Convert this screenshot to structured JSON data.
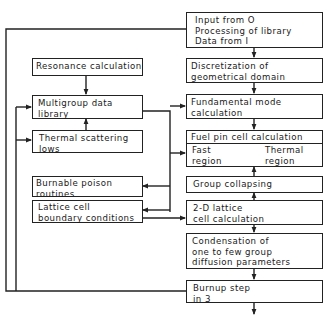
{
  "diagram": {
    "type": "flowchart",
    "boxes": {
      "input": {
        "lines": [
          "Input from O",
          "Processing of library",
          "Data from I"
        ]
      },
      "discretization": {
        "lines": [
          "Discretization of",
          "geometrical domain"
        ]
      },
      "fundamental": {
        "lines": [
          "Fundamental mode",
          "calculation"
        ]
      },
      "fuel_pin": {
        "title": "Fuel pin cell calculation",
        "left": {
          "lines": [
            "Fast",
            "region"
          ]
        },
        "right": {
          "lines": [
            "Thermal",
            "region"
          ]
        }
      },
      "group_collapsing": {
        "lines": [
          "Group collapsing"
        ]
      },
      "lattice_2d": {
        "lines": [
          "2-D lattice",
          "cell calculation"
        ]
      },
      "condensation": {
        "lines": [
          "Condensation of",
          "one to few group",
          "diffusion parameters"
        ]
      },
      "burnup": {
        "lines": [
          "Burnup step",
          "in 3"
        ]
      },
      "resonance": {
        "lines": [
          "Resonance calculation"
        ]
      },
      "multigroup": {
        "lines": [
          "Multigroup data",
          "library"
        ]
      },
      "thermal_scattering": {
        "lines": [
          "Thermal scattering",
          "lows"
        ]
      },
      "burnable_poison": {
        "lines": [
          "Burnable poison",
          "routines"
        ]
      },
      "lattice_boundary": {
        "lines": [
          "Lattice cell",
          "boundary conditions"
        ]
      }
    },
    "edges": [
      [
        "input",
        "discretization"
      ],
      [
        "discretization",
        "fundamental"
      ],
      [
        "fundamental",
        "fuel_pin"
      ],
      [
        "group_collapsing",
        "fuel_pin"
      ],
      [
        "lattice_2d",
        "group_collapsing"
      ],
      [
        "lattice_2d",
        "condensation"
      ],
      [
        "condensation",
        "burnup"
      ],
      [
        "resonance",
        "multigroup"
      ],
      [
        "thermal_scattering",
        "multigroup"
      ],
      [
        "multigroup",
        "fundamental"
      ],
      [
        "multigroup",
        "fuel_pin"
      ],
      [
        "multigroup",
        "burnable_poison"
      ],
      [
        "multigroup",
        "lattice_boundary"
      ],
      [
        "lattice_boundary",
        "lattice_2d"
      ],
      [
        "burnup",
        "input (loop)"
      ],
      [
        "loop",
        "multigroup"
      ],
      [
        "loop",
        "thermal_scattering"
      ]
    ]
  }
}
